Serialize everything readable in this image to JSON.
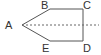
{
  "diagram": {
    "type": "geometry",
    "shape": "pentagon",
    "stroke_color": "#555555",
    "dash_color": "#666666",
    "vertices": [
      {
        "label": "A",
        "x": 22,
        "y": 25,
        "lx": 5,
        "ly": 29
      },
      {
        "label": "B",
        "x": 50,
        "y": 9,
        "lx": 41,
        "ly": 9
      },
      {
        "label": "C",
        "x": 83,
        "y": 9,
        "lx": 83,
        "ly": 9
      },
      {
        "label": "D",
        "x": 83,
        "y": 41,
        "lx": 83,
        "ly": 52
      },
      {
        "label": "E",
        "x": 50,
        "y": 41,
        "lx": 42,
        "ly": 52
      }
    ],
    "edges": [
      [
        "A",
        "B"
      ],
      [
        "B",
        "C"
      ],
      [
        "C",
        "D"
      ],
      [
        "D",
        "E"
      ],
      [
        "E",
        "A"
      ]
    ],
    "dashed_line": {
      "from": "A",
      "x1": 22,
      "y1": 25,
      "x2": 99,
      "y2": 25,
      "description": "axis of symmetry"
    }
  }
}
